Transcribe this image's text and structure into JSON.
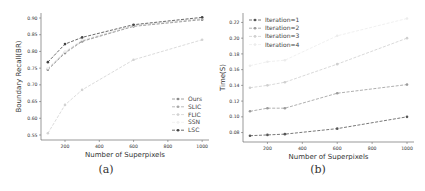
{
  "chart_data": [
    {
      "id": "a",
      "type": "line",
      "caption": "(a)",
      "title": "",
      "xlabel": "Number of Superpixels",
      "ylabel": "Boundary Recall(BR)",
      "x": [
        100,
        200,
        300,
        600,
        1000
      ],
      "xlim": [
        60,
        1040
      ],
      "ylim": [
        0.535,
        0.915
      ],
      "xticks": [
        200,
        400,
        600,
        800,
        1000
      ],
      "yticks": [
        0.55,
        0.6,
        0.65,
        0.7,
        0.75,
        0.8,
        0.85,
        0.9
      ],
      "ytick_labels": [
        "0.55",
        "0.60",
        "0.65",
        "0.70",
        "0.75",
        "0.80",
        "0.85",
        "0.90"
      ],
      "grid": false,
      "legend_position": "lower right",
      "series": [
        {
          "name": "Ours",
          "color": "#8a8a8a",
          "dash": "3,1.5",
          "values": [
            0.745,
            0.795,
            0.83,
            0.875,
            0.895
          ]
        },
        {
          "name": "SLIC",
          "color": "#a8a8a8",
          "dash": "3,1.5",
          "values": [
            0.748,
            0.798,
            0.832,
            0.877,
            0.898
          ]
        },
        {
          "name": "FLIC",
          "color": "#d2d2d2",
          "dash": "3,1.5",
          "values": [
            0.555,
            0.64,
            0.685,
            0.775,
            0.835
          ]
        },
        {
          "name": "SSN",
          "color": "#f0f0f0",
          "dash": "3,1.5",
          "values": [
            0.75,
            0.8,
            0.835,
            0.878,
            0.9
          ]
        },
        {
          "name": "LSC",
          "color": "#444444",
          "dash": "3,1.5",
          "values": [
            0.768,
            0.822,
            0.842,
            0.88,
            0.902
          ]
        }
      ]
    },
    {
      "id": "b",
      "type": "line",
      "caption": "(b)",
      "title": "",
      "xlabel": "Number of Superpixels",
      "ylabel": "Time(S)",
      "x": [
        100,
        200,
        300,
        600,
        1000
      ],
      "xlim": [
        60,
        1040
      ],
      "ylim": [
        0.068,
        0.232
      ],
      "xticks": [
        200,
        400,
        600,
        800,
        1000
      ],
      "yticks": [
        0.08,
        0.1,
        0.12,
        0.14,
        0.16,
        0.18,
        0.2,
        0.22
      ],
      "ytick_labels": [
        "0.08",
        "0.10",
        "0.12",
        "0.14",
        "0.16",
        "0.18",
        "0.20",
        "0.22"
      ],
      "grid": false,
      "legend_position": "upper left",
      "series": [
        {
          "name": "Iteration=1",
          "color": "#555555",
          "dash": "3,1.5",
          "values": [
            0.076,
            0.077,
            0.078,
            0.085,
            0.1
          ]
        },
        {
          "name": "Iteration=2",
          "color": "#9a9a9a",
          "dash": "3,1.5",
          "values": [
            0.107,
            0.111,
            0.111,
            0.13,
            0.141
          ]
        },
        {
          "name": "Iteration=3",
          "color": "#cfcfcf",
          "dash": "3,1.5",
          "values": [
            0.137,
            0.14,
            0.144,
            0.167,
            0.2
          ]
        },
        {
          "name": "Iteration=4",
          "color": "#ececec",
          "dash": "3,1.5",
          "values": [
            0.165,
            0.17,
            0.172,
            0.203,
            0.225
          ]
        }
      ]
    }
  ]
}
